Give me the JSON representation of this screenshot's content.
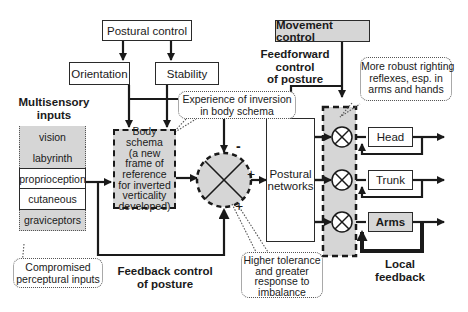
{
  "boxes": {
    "postural_control": "Postural control",
    "orientation": "Orientation",
    "stability": "Stability",
    "movement_control": "Movement control",
    "body_schema": [
      "Body",
      "schema",
      "(a new",
      "frame of",
      "reference",
      "for inverted",
      "verticality",
      "developed)"
    ],
    "postural_networks": [
      "Postural",
      "networks"
    ],
    "outputs": [
      {
        "label": "Head",
        "shaded": false
      },
      {
        "label": "Trunk",
        "shaded": false
      },
      {
        "label": "Arms",
        "shaded": true
      }
    ]
  },
  "sensory": {
    "heading": [
      "Multisensory",
      "inputs"
    ],
    "items": [
      {
        "label": "vision",
        "compromised": true
      },
      {
        "label": "labyrinth",
        "compromised": true
      },
      {
        "label": "proprioception",
        "compromised": false
      },
      {
        "label": "cutaneous",
        "compromised": false
      },
      {
        "label": "graviceptors",
        "compromised": true
      }
    ]
  },
  "labels": {
    "feedforward": [
      "Feedforward",
      "control",
      "of posture"
    ],
    "feedback": [
      "Feedback control",
      "of posture"
    ],
    "local_feedback": [
      "Local",
      "feedback"
    ],
    "minus_sign": "-",
    "plus_sign_right": "+",
    "plus_sign_bottom": "+"
  },
  "callouts": {
    "experience": [
      "Experience of inversion",
      "in body schema"
    ],
    "righting": [
      "More robust righting",
      "reflexes, esp. in",
      "arms and hands"
    ],
    "compromised": [
      "Compromised",
      "perceptural inputs"
    ],
    "tolerance": [
      "Higher tolerance",
      "and greater",
      "response to",
      "imbalance"
    ]
  },
  "colors": {
    "line": "#1a1a1a",
    "shade": "#d6d6d6",
    "dotted": "#555555"
  }
}
